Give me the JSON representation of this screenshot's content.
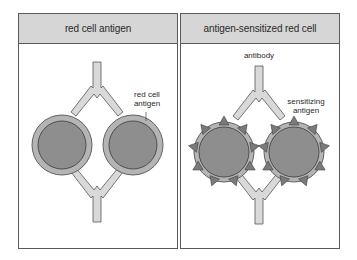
{
  "panels": [
    {
      "header": "red cell antigen",
      "labels": {
        "antigen": "red cell\nantigen"
      }
    },
    {
      "header": "antigen-sensitized red cell",
      "labels": {
        "antibody": "antibody",
        "antigen": "sensitizing\nantigen"
      }
    }
  ],
  "colors": {
    "header_fill": "#d6d6d6",
    "cell_outer": "#b4b4b4",
    "cell_inner": "#8e8e8e",
    "antibody_fill": "#d9d9d9",
    "outline": "#555555",
    "antigen_spike": "#7a7a7a"
  }
}
